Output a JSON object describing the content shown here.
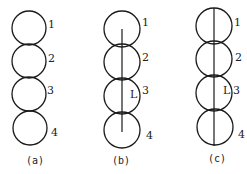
{
  "panels": [
    {
      "caption": "(a)",
      "circle_labels": [
        "1",
        "2",
        "3",
        "4"
      ],
      "axis": "none",
      "inner_label": ""
    },
    {
      "caption": "(b)",
      "circle_labels": [
        "1",
        "2",
        "3",
        "4"
      ],
      "axis": "partial (center of circle 1 to center of circle 4)",
      "inner_label": "L"
    },
    {
      "caption": "(c)",
      "circle_labels": [
        "1",
        "2",
        "3",
        "4"
      ],
      "axis": "full (top of circle 1 to bottom of circle 4)",
      "inner_label": "L"
    }
  ],
  "colors": {
    "stroke": "#1a1a1a",
    "background": "#ffffff"
  }
}
